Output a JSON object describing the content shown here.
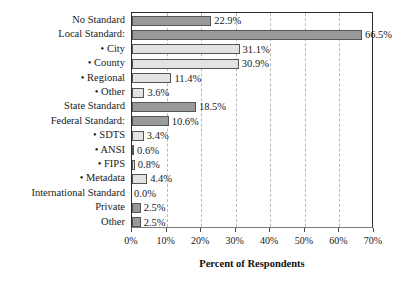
{
  "chart_data": {
    "type": "bar",
    "orientation": "horizontal",
    "title": "",
    "xlabel": "Percent of Respondents",
    "ylabel": "",
    "xlim": [
      0,
      70
    ],
    "xtick_labels": [
      "0%",
      "10%",
      "20%",
      "30%",
      "40%",
      "50%",
      "60%",
      "70%"
    ],
    "xticks": [
      0,
      10,
      20,
      30,
      40,
      50,
      60,
      70
    ],
    "grid": "vertical-dashed",
    "legend": "none",
    "value_suffix": "%",
    "categories": [
      "No Standard",
      "Local Standard:",
      "• City",
      "• County",
      "• Regional",
      "• Other",
      "State Standard",
      "Federal Standard:",
      "• SDTS",
      "• ANSI",
      "• FIPS",
      "• Metadata",
      "International Standard",
      "Private",
      "Other"
    ],
    "values": [
      22.9,
      66.5,
      31.1,
      30.9,
      11.4,
      3.6,
      18.5,
      10.6,
      3.4,
      0.6,
      0.8,
      4.4,
      0.0,
      2.5,
      2.5
    ],
    "value_labels": [
      "22.9%",
      "66.5%",
      "31.1%",
      "30.9%",
      "11.4%",
      "3.6%",
      "18.5%",
      "10.6%",
      "3.4%",
      "0.6%",
      "0.8%",
      "4.4%",
      "0.0%",
      "2.5%",
      "2.5%"
    ],
    "shades": [
      "dark",
      "dark",
      "light",
      "light",
      "light",
      "light",
      "dark",
      "dark",
      "light",
      "light",
      "light",
      "light",
      "none",
      "dark",
      "dark"
    ],
    "colors": {
      "bar_dark": "#9a9a9a",
      "bar_light": "#e2e2e2",
      "bar_edge": "#555555",
      "gridline": "#b9b9b9",
      "axis": "#2b2b2b",
      "text": "#1a1a1a",
      "background": "#ffffff"
    }
  }
}
